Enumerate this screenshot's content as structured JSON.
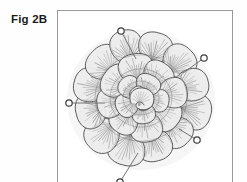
{
  "figure": {
    "label": "Fig 2B",
    "caption_visible": false
  },
  "frame": {
    "border_color": "#9a9a9a",
    "background_color": "#ffffff",
    "x": 57,
    "y": 10,
    "width": 176,
    "height": 185
  },
  "illustration": {
    "subject": "rosette-of-overlapping-leaves",
    "style": "pencil-line-drawing-grayscale",
    "center_x": 140,
    "center_y": 97,
    "line_color": "#4a4a4a",
    "fill_color": "#ededed",
    "vein_color": "#8d8d8d",
    "whorls": [
      {
        "name": "outer-whorl",
        "leaf_count": 12,
        "radius": 52,
        "leaf_rx": 19,
        "leaf_ry": 15
      },
      {
        "name": "middle-whorl",
        "leaf_count": 8,
        "radius": 30,
        "leaf_rx": 17,
        "leaf_ry": 13
      },
      {
        "name": "inner-whorl",
        "leaf_count": 5,
        "radius": 15,
        "leaf_rx": 13,
        "leaf_ry": 10
      },
      {
        "name": "core-bud",
        "leaf_count": 2,
        "radius": 5,
        "leaf_rx": 9,
        "leaf_ry": 7
      }
    ]
  },
  "callouts": [
    {
      "id": "callout-top-left",
      "marker_x": 120,
      "marker_y": 30,
      "line_to_x": 135,
      "line_to_y": 58,
      "marker_radius": 3.2,
      "label": ""
    },
    {
      "id": "callout-top-right",
      "marker_x": 203,
      "marker_y": 57,
      "line_to_x": 182,
      "line_to_y": 72,
      "marker_radius": 3.2,
      "label": ""
    },
    {
      "id": "callout-left",
      "marker_x": 68,
      "marker_y": 102,
      "line_to_x": 104,
      "line_to_y": 102,
      "marker_radius": 3.2,
      "label": ""
    },
    {
      "id": "callout-bottom-right",
      "marker_x": 196,
      "marker_y": 139,
      "line_to_x": 178,
      "line_to_y": 128,
      "marker_radius": 3.2,
      "label": ""
    },
    {
      "id": "callout-bottom",
      "marker_x": 119,
      "marker_y": 181,
      "line_to_x": 137,
      "line_to_y": 152,
      "marker_radius": 3.2,
      "label": ""
    }
  ],
  "colors": {
    "page_background": "#fefefe",
    "text": "#1a1a1a",
    "frame_border": "#9a9a9a",
    "ink": "#4a4a4a",
    "shading": "#8d8d8d",
    "leaf_fill": "#ededed"
  }
}
